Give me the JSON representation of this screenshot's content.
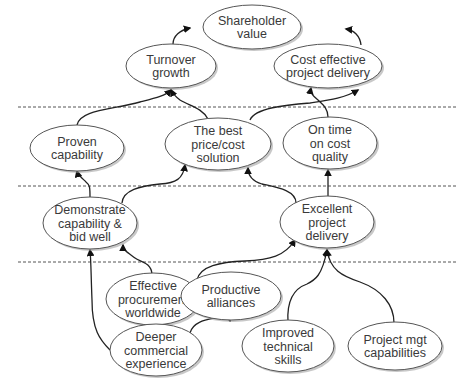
{
  "diagram": {
    "type": "strategy-map",
    "separators_y": [
      107,
      186,
      262
    ],
    "nodes": [
      {
        "id": "shareholder",
        "lines": [
          "Shareholder",
          "value"
        ],
        "cx": 252,
        "cy": 27,
        "rx": 49,
        "ry": 22
      },
      {
        "id": "turnover",
        "lines": [
          "Turnover",
          "growth"
        ],
        "cx": 171,
        "cy": 66,
        "rx": 45,
        "ry": 22
      },
      {
        "id": "cost_effective",
        "lines": [
          "Cost effective",
          "project delivery"
        ],
        "cx": 328,
        "cy": 66,
        "rx": 54,
        "ry": 22
      },
      {
        "id": "proven",
        "lines": [
          "Proven",
          "capability"
        ],
        "cx": 77,
        "cy": 148,
        "rx": 47,
        "ry": 23
      },
      {
        "id": "best_price",
        "lines": [
          "The best",
          "price/cost",
          "solution"
        ],
        "cx": 218,
        "cy": 144,
        "rx": 53,
        "ry": 26
      },
      {
        "id": "on_time",
        "lines": [
          "On time",
          "on cost",
          "quality"
        ],
        "cx": 330,
        "cy": 143,
        "rx": 47,
        "ry": 26
      },
      {
        "id": "demonstrate",
        "lines": [
          "Demonstrate",
          "capability &",
          "bid well"
        ],
        "cx": 90,
        "cy": 223,
        "rx": 47,
        "ry": 26
      },
      {
        "id": "excellent",
        "lines": [
          "Excellent",
          "project",
          "delivery"
        ],
        "cx": 327,
        "cy": 222,
        "rx": 47,
        "ry": 26
      },
      {
        "id": "effective_proc",
        "lines": [
          "Effective",
          "procurement",
          "worldwide"
        ],
        "cx": 153,
        "cy": 299,
        "rx": 47,
        "ry": 26
      },
      {
        "id": "productive",
        "lines": [
          "Productive",
          "alliances"
        ],
        "cx": 231,
        "cy": 296,
        "rx": 50,
        "ry": 24
      },
      {
        "id": "deeper",
        "lines": [
          "Deeper",
          "commercial",
          "experience"
        ],
        "cx": 156,
        "cy": 350,
        "rx": 46,
        "ry": 26
      },
      {
        "id": "improved",
        "lines": [
          "Improved",
          "technical",
          "skills"
        ],
        "cx": 288,
        "cy": 346,
        "rx": 46,
        "ry": 26
      },
      {
        "id": "project_mgt",
        "lines": [
          "Project mgt",
          "capabilities"
        ],
        "cx": 395,
        "cy": 346,
        "rx": 47,
        "ry": 24
      }
    ],
    "edges": [
      {
        "from": "turnover",
        "to": "shareholder",
        "path": "M173 44 C173 36 180 30 190 28",
        "arrow": [
          203,
          25
        ]
      },
      {
        "from": "cost_effective",
        "to": "shareholder",
        "path": "M361 45 C360 36 354 30 346 29",
        "arrow": [
          345,
          28
        ]
      },
      {
        "from": "proven",
        "to": "turnover",
        "path": "M77 125 C80 110 110 110 140 102 C156 98 165 96 171 90",
        "arrow": [
          171,
          89
        ]
      },
      {
        "from": "best_price",
        "to": "turnover",
        "path": "M208 119 C202 108 190 106 180 100 C176 97 173 94 171 90",
        "arrow": [
          171,
          89
        ]
      },
      {
        "from": "best_price",
        "to": "cost_effective",
        "path": "M250 120 C255 108 285 105 310 103 C330 100 345 98 358 90",
        "arrow": [
          360,
          88
        ]
      },
      {
        "from": "on_time",
        "to": "cost_effective",
        "path": "M328 117 C328 108 322 104 318 100 C313 96 310 93 311 88",
        "arrow": [
          300,
          88
        ]
      },
      {
        "from": "demonstrate",
        "to": "proven",
        "path": "M90 197 C90 188 90 185 86 182 C82 178 78 175 77 171",
        "arrow": [
          77,
          171
        ]
      },
      {
        "from": "demonstrate",
        "to": "best_price",
        "path": "M122 203 C123 190 140 186 160 184 C176 183 183 179 185 165",
        "arrow": [
          185,
          163
        ]
      },
      {
        "from": "excellent",
        "to": "best_price",
        "path": "M296 203 C296 190 275 187 262 184 C252 181 248 176 248 168",
        "arrow": [
          248,
          166
        ]
      },
      {
        "from": "excellent",
        "to": "on_time",
        "path": "M328 196 L328 170",
        "arrow": [
          328,
          169
        ]
      },
      {
        "from": "deeper",
        "to": "demonstrate",
        "path": "M110 350 C100 340 92 330 92 300 C91 275 91 260 90 250",
        "arrow": [
          90,
          249
        ]
      },
      {
        "from": "effective_proc",
        "to": "demonstrate",
        "path": "M152 274 C151 262 140 262 135 258 C127 252 123 250 123 245",
        "arrow": [
          123,
          243
        ]
      },
      {
        "from": "productive",
        "to": "excellent",
        "path": "M197 280 C200 266 220 262 245 261 C270 260 285 256 295 240",
        "arrow": [
          296,
          238
        ]
      },
      {
        "from": "deeper",
        "to": "productive",
        "path": "M190 333 C193 322 205 320 215 318 C224 316 228 314 230 321",
        "arrow": [
          230,
          321
        ]
      },
      {
        "from": "improved",
        "to": "excellent",
        "path": "M288 322 C287 306 290 290 307 284 C315 280 322 276 327 250",
        "arrow": [
          327,
          249
        ]
      },
      {
        "from": "project_mgt",
        "to": "excellent",
        "path": "M394 323 C394 305 382 290 360 282 C342 276 330 270 327 250",
        "arrow": [
          327,
          249
        ]
      }
    ]
  }
}
